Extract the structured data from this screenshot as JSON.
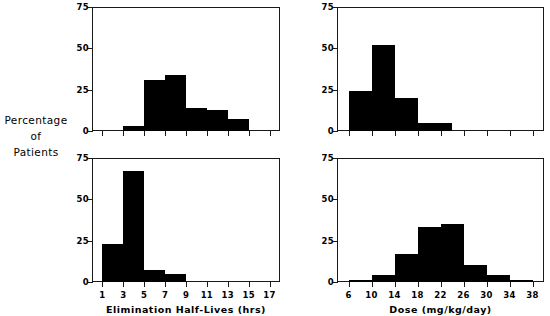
{
  "figure": {
    "y_axis_title_lines": [
      "Percentage",
      "of",
      "Patients"
    ]
  },
  "chart_data": [
    {
      "id": "top-left",
      "type": "bar",
      "title": "",
      "xlabel": "",
      "ylabel": "Percentage of Patients",
      "xlim": [
        0,
        18
      ],
      "ylim": [
        0,
        75
      ],
      "xticks": [
        1,
        3,
        5,
        7,
        9,
        11,
        13,
        15,
        17
      ],
      "yticks": [
        0,
        25,
        50,
        75
      ],
      "grid": false,
      "legend": "none",
      "bin_width": 2,
      "bins": [
        {
          "x0": 3,
          "x1": 5,
          "value": 3
        },
        {
          "x0": 5,
          "x1": 7,
          "value": 31
        },
        {
          "x0": 7,
          "x1": 9,
          "value": 34
        },
        {
          "x0": 9,
          "x1": 11,
          "value": 14
        },
        {
          "x0": 11,
          "x1": 13,
          "value": 13
        },
        {
          "x0": 13,
          "x1": 15,
          "value": 7
        }
      ]
    },
    {
      "id": "top-right",
      "type": "bar",
      "title": "",
      "xlabel": "",
      "ylabel": "Percentage of Patients",
      "xlim": [
        4,
        40
      ],
      "ylim": [
        0,
        75
      ],
      "xticks": [
        6,
        10,
        14,
        18,
        22,
        26,
        30,
        34,
        38
      ],
      "yticks": [
        0,
        25,
        50,
        75
      ],
      "grid": false,
      "legend": "none",
      "bin_width": 4,
      "bins": [
        {
          "x0": 6,
          "x1": 10,
          "value": 24
        },
        {
          "x0": 10,
          "x1": 14,
          "value": 52
        },
        {
          "x0": 14,
          "x1": 18,
          "value": 20
        },
        {
          "x0": 18,
          "x1": 22,
          "value": 5
        },
        {
          "x0": 22,
          "x1": 24,
          "value": 5
        }
      ]
    },
    {
      "id": "bottom-left",
      "type": "bar",
      "title": "",
      "xlabel": "Elimination Half-Lives (hrs)",
      "ylabel": "Percentage of Patients",
      "xlim": [
        0,
        18
      ],
      "ylim": [
        0,
        75
      ],
      "xticks": [
        1,
        3,
        5,
        7,
        9,
        11,
        13,
        15,
        17
      ],
      "yticks": [
        0,
        25,
        50,
        75
      ],
      "grid": false,
      "legend": "none",
      "bin_width": 2,
      "bins": [
        {
          "x0": 1,
          "x1": 3,
          "value": 23
        },
        {
          "x0": 3,
          "x1": 5,
          "value": 67
        },
        {
          "x0": 5,
          "x1": 7,
          "value": 7
        },
        {
          "x0": 7,
          "x1": 9,
          "value": 5
        }
      ]
    },
    {
      "id": "bottom-right",
      "type": "bar",
      "title": "",
      "xlabel": "Dose (mg/kg/day)",
      "ylabel": "Percentage of Patients",
      "xlim": [
        4,
        40
      ],
      "ylim": [
        0,
        75
      ],
      "xticks": [
        6,
        10,
        14,
        18,
        22,
        26,
        30,
        34,
        38
      ],
      "yticks": [
        0,
        25,
        50,
        75
      ],
      "grid": false,
      "legend": "none",
      "bin_width": 4,
      "bins": [
        {
          "x0": 6,
          "x1": 10,
          "value": 1
        },
        {
          "x0": 10,
          "x1": 14,
          "value": 4
        },
        {
          "x0": 14,
          "x1": 18,
          "value": 17
        },
        {
          "x0": 18,
          "x1": 22,
          "value": 33
        },
        {
          "x0": 22,
          "x1": 26,
          "value": 35
        },
        {
          "x0": 26,
          "x1": 30,
          "value": 10
        },
        {
          "x0": 30,
          "x1": 34,
          "value": 4
        },
        {
          "x0": 34,
          "x1": 38,
          "value": 1
        }
      ]
    }
  ]
}
